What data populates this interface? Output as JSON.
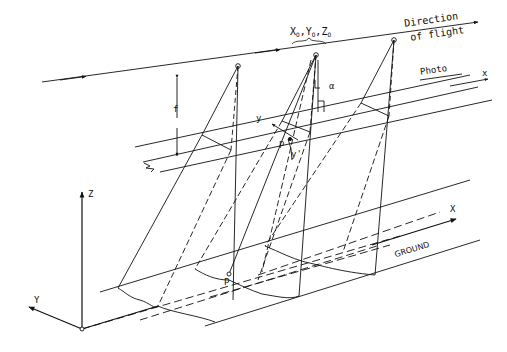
{
  "figure": {
    "labels": {
      "direction_line1": "Direction",
      "direction_line2": "of flight",
      "exposure_station_x": "X",
      "exposure_station_y": "Y",
      "exposure_station_z": "Z",
      "exposure_sub": "O",
      "comma": ",",
      "photo": "Photo",
      "photo_x_axis": "x",
      "photo_y_axis": "y",
      "y_prime": "y'",
      "image_point": "p",
      "alpha": "α",
      "focal_length": "f",
      "ground": "GROUND",
      "ground_point": "P",
      "ground_X_axis": "X",
      "ground_Y_axis": "Y",
      "ground_Z_axis": "Z"
    },
    "line_color": "#111111",
    "background": "#ffffff"
  }
}
